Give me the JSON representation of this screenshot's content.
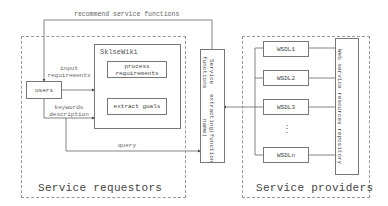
{
  "diagram": {
    "top_arrow_label": "recommend service functions",
    "requestors": {
      "title": "Service requestors",
      "users": "users",
      "input_label_1": "input",
      "input_label_2": "requirements",
      "keywords_label_1": "keywords",
      "keywords_label_2": "description",
      "query_label": "query",
      "sklsewiki": {
        "title": "SklseWiki",
        "process_1": "process",
        "process_2": "requirements",
        "extract": "extract goals"
      }
    },
    "extractor": {
      "line1": "Service functions",
      "line2": "extracting(function name)"
    },
    "providers": {
      "title": "Service providers",
      "wsdl": [
        "WSDL1",
        "WSDL2",
        "WSDL3",
        "WSDLn"
      ],
      "ellipsis": "⋮",
      "repository": "Web service resources repository"
    }
  }
}
